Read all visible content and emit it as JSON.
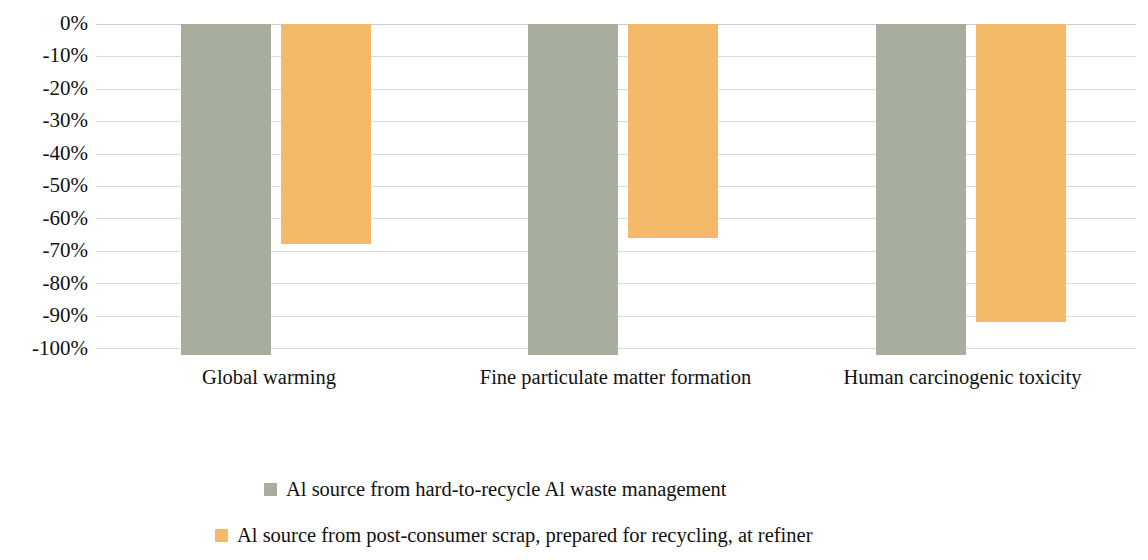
{
  "chart_data": {
    "type": "bar",
    "title": "",
    "subtitle": "",
    "xlabel": "",
    "ylabel": "",
    "categories": [
      "Global warming",
      "Fine particulate matter formation",
      "Human carcinogenic toxicity"
    ],
    "series": [
      {
        "name": "Al source from hard-to-recycle Al waste management",
        "color": "#a8ae9e",
        "values": [
          -100,
          -100,
          -100
        ]
      },
      {
        "name": "Al source from post-consumer scrap, prepared for recycling, at refiner",
        "color": "#f4b969",
        "values": [
          -68,
          -66,
          -92
        ]
      }
    ],
    "ylim": [
      -100,
      0
    ],
    "y_ticks": [
      0,
      -10,
      -20,
      -30,
      -40,
      -50,
      -60,
      -70,
      -80,
      -90,
      -100
    ],
    "y_tick_labels": [
      "0%",
      "-10%",
      "-20%",
      "-30%",
      "-40%",
      "-50%",
      "-60%",
      "-70%",
      "-80%",
      "-90%",
      "-100%"
    ],
    "grid": true,
    "grid_axis": "y",
    "legend_position": "bottom",
    "orientation": "vertical",
    "bar_direction": "downward"
  },
  "legend": {
    "items": [
      {
        "label": "Al source from hard-to-recycle Al waste management",
        "swatch_color": "#a8ae9e"
      },
      {
        "label": "Al source from post-consumer scrap, prepared for recycling, at refiner",
        "swatch_color": "#f4b969"
      }
    ]
  }
}
